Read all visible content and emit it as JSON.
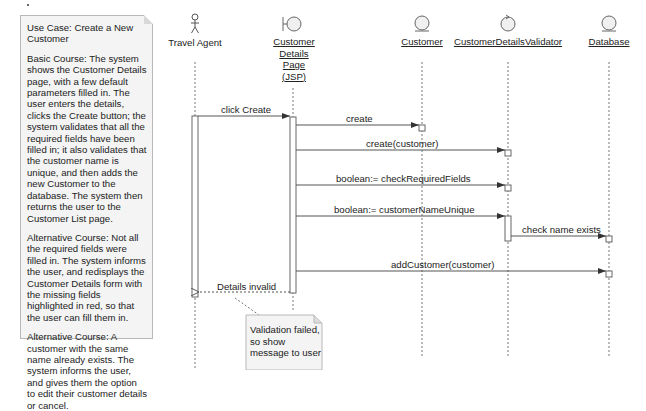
{
  "use_case_note": {
    "title": "Use Case: Create a New Customer",
    "basic_course": "Basic Course: The system shows the Customer Details page, with a few default parameters filled in. The user enters the details, clicks the Create button; the system validates that all the required fields have been filled in; it also validates that the customer name is unique, and then adds the new Customer to the database. The system then returns the user to the Customer List page.",
    "alternative_course_1": "Alternative Course: Not all the required fields were filled in. The system informs the user, and redisplays the Customer Details form with the missing fields highlighted in red, so that the user can fill them in.",
    "alternative_course_2": "Alternative Course: A customer with the same name already exists. The system informs the user, and gives them the option to edit their customer details or cancel."
  },
  "participants": [
    {
      "name": "Travel Agent",
      "kind": "actor"
    },
    {
      "name_lines": [
        "Customer",
        "Details",
        "Page",
        "(JSP)"
      ],
      "kind": "boundary"
    },
    {
      "name": "Customer",
      "kind": "entity"
    },
    {
      "name": "CustomerDetailsValidator",
      "kind": "control"
    },
    {
      "name": "Database",
      "kind": "entity"
    }
  ],
  "messages": [
    {
      "label": "click Create",
      "from": "Travel Agent",
      "to": "Customer Details Page (JSP)"
    },
    {
      "label": "create",
      "from": "Customer Details Page (JSP)",
      "to": "Customer"
    },
    {
      "label": "create(customer)",
      "from": "Customer Details Page (JSP)",
      "to": "CustomerDetailsValidator"
    },
    {
      "label": "boolean:= checkRequiredFields",
      "from": "Customer Details Page (JSP)",
      "to": "CustomerDetailsValidator"
    },
    {
      "label": "boolean:= customerNameUnique",
      "from": "Customer Details Page (JSP)",
      "to": "CustomerDetailsValidator"
    },
    {
      "label": "check name exists",
      "from": "CustomerDetailsValidator",
      "to": "Database"
    },
    {
      "label": "addCustomer(customer)",
      "from": "Customer Details Page (JSP)",
      "to": "Database"
    },
    {
      "label": "Details invalid",
      "from": "Customer Details Page (JSP)",
      "to": "Travel Agent",
      "type": "return"
    }
  ],
  "validation_note": {
    "lines": [
      "Validation failed,",
      "so show",
      "message to user"
    ]
  },
  "colors": {
    "line": "#555555",
    "note_fill": "#f4f4f4",
    "note_border": "#b8b8b8",
    "icon_fill": "#f0f0f0"
  }
}
